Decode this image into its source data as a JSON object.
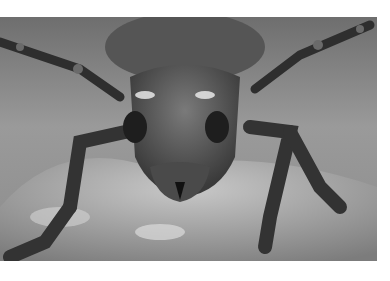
{
  "image": {
    "subject": "Close-up grayscale photo of a longhorn beetle facing the camera on a mottled surface",
    "colors": {
      "background": "#ffffff",
      "photo_mid": "#8a8a8a",
      "beetle_dark": "#2a2a2a",
      "highlight": "#e8e8e8"
    }
  }
}
